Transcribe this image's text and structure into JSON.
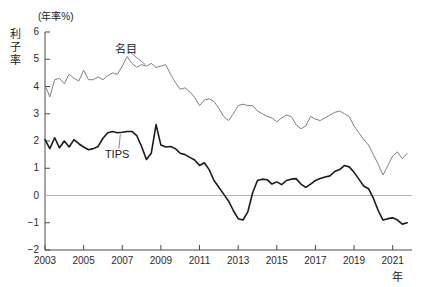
{
  "chart_data": {
    "type": "line",
    "title": "",
    "unit_note": "(年率%)",
    "ylabel": "利子率",
    "xlabel": "年",
    "ylim": [
      -2,
      6
    ],
    "xlim": [
      2003,
      2022
    ],
    "yticks": [
      6,
      5,
      4,
      3,
      2,
      1,
      0,
      -1,
      -2
    ],
    "ytick_labels": [
      "6",
      "5",
      "4",
      "3",
      "2",
      "1",
      "0",
      "−1",
      "−2"
    ],
    "xticks": [
      2003,
      2005,
      2007,
      2009,
      2011,
      2013,
      2015,
      2017,
      2019,
      2021
    ],
    "xtick_labels": [
      "2003",
      "2005",
      "2007",
      "2009",
      "2011",
      "2013",
      "2015",
      "2017",
      "2019",
      "2021"
    ],
    "grid": false,
    "zero_line": true,
    "legend_position": "inline-annotation",
    "series": [
      {
        "name": "名目",
        "label": "名目",
        "color": "#808080",
        "width": 1,
        "label_x": 2006.6,
        "label_y": 5.45,
        "anchor_x": 2008.2,
        "anchor_y": 4.8,
        "x": [
          2003.0,
          2003.25,
          2003.5,
          2003.75,
          2004.0,
          2004.25,
          2004.5,
          2004.75,
          2005.0,
          2005.25,
          2005.5,
          2005.75,
          2006.0,
          2006.25,
          2006.5,
          2006.75,
          2007.0,
          2007.25,
          2007.5,
          2007.75,
          2008.0,
          2008.25,
          2008.5,
          2008.75,
          2009.0,
          2009.25,
          2009.5,
          2009.75,
          2010.0,
          2010.25,
          2010.5,
          2010.75,
          2011.0,
          2011.25,
          2011.5,
          2011.75,
          2012.0,
          2012.25,
          2012.5,
          2012.75,
          2013.0,
          2013.25,
          2013.5,
          2013.75,
          2014.0,
          2014.25,
          2014.5,
          2014.75,
          2015.0,
          2015.25,
          2015.5,
          2015.75,
          2016.0,
          2016.25,
          2016.5,
          2016.75,
          2017.0,
          2017.25,
          2017.5,
          2017.75,
          2018.0,
          2018.25,
          2018.5,
          2018.75,
          2019.0,
          2019.25,
          2019.5,
          2019.75,
          2020.0,
          2020.25,
          2020.5,
          2020.75,
          2021.0,
          2021.25,
          2021.5,
          2021.75
        ],
        "values": [
          4.05,
          3.62,
          4.25,
          4.3,
          4.1,
          4.45,
          4.3,
          4.2,
          4.6,
          4.25,
          4.25,
          4.35,
          4.25,
          4.4,
          4.5,
          4.45,
          4.75,
          5.1,
          4.85,
          4.7,
          4.8,
          4.75,
          4.85,
          4.7,
          4.75,
          4.8,
          4.45,
          4.15,
          3.9,
          3.95,
          3.8,
          3.6,
          3.3,
          3.5,
          3.55,
          3.45,
          3.2,
          2.9,
          2.75,
          3.0,
          3.3,
          3.35,
          3.3,
          3.3,
          3.1,
          3.0,
          2.9,
          2.85,
          2.7,
          2.85,
          2.95,
          2.9,
          2.6,
          2.45,
          2.55,
          2.9,
          2.8,
          2.75,
          2.85,
          2.95,
          3.05,
          3.1,
          3.0,
          2.9,
          2.55,
          2.3,
          2.05,
          1.85,
          1.5,
          1.15,
          0.75,
          1.1,
          1.45,
          1.6,
          1.35,
          1.55
        ]
      },
      {
        "name": "TIPS",
        "label": "TIPS",
        "color": "#1a1a1a",
        "width": 1.6,
        "label_x": 2006.1,
        "label_y": 1.47,
        "anchor_x": 2006.9,
        "anchor_y": 2.25,
        "x": [
          2003.0,
          2003.25,
          2003.5,
          2003.75,
          2004.0,
          2004.25,
          2004.5,
          2004.75,
          2005.0,
          2005.25,
          2005.5,
          2005.75,
          2006.0,
          2006.25,
          2006.5,
          2006.75,
          2007.0,
          2007.25,
          2007.5,
          2007.75,
          2008.0,
          2008.25,
          2008.5,
          2008.75,
          2009.0,
          2009.25,
          2009.5,
          2009.75,
          2010.0,
          2010.25,
          2010.5,
          2010.75,
          2011.0,
          2011.25,
          2011.5,
          2011.75,
          2012.0,
          2012.25,
          2012.5,
          2012.75,
          2013.0,
          2013.25,
          2013.5,
          2013.75,
          2014.0,
          2014.25,
          2014.5,
          2014.75,
          2015.0,
          2015.25,
          2015.5,
          2015.75,
          2016.0,
          2016.25,
          2016.5,
          2016.75,
          2017.0,
          2017.25,
          2017.5,
          2017.75,
          2018.0,
          2018.25,
          2018.5,
          2018.75,
          2019.0,
          2019.25,
          2019.5,
          2019.75,
          2020.0,
          2020.25,
          2020.5,
          2020.75,
          2021.0,
          2021.25,
          2021.5,
          2021.75
        ],
        "values": [
          2.05,
          1.72,
          2.12,
          1.75,
          2.0,
          1.78,
          2.05,
          1.9,
          1.78,
          1.68,
          1.72,
          1.8,
          2.1,
          2.3,
          2.35,
          2.3,
          2.32,
          2.35,
          2.35,
          2.2,
          1.8,
          1.32,
          1.55,
          2.6,
          1.85,
          1.78,
          1.8,
          1.72,
          1.55,
          1.5,
          1.4,
          1.3,
          1.1,
          1.2,
          0.95,
          0.55,
          0.3,
          0.05,
          -0.2,
          -0.55,
          -0.85,
          -0.9,
          -0.6,
          0.1,
          0.55,
          0.6,
          0.58,
          0.42,
          0.5,
          0.4,
          0.55,
          0.6,
          0.62,
          0.42,
          0.3,
          0.42,
          0.55,
          0.62,
          0.68,
          0.72,
          0.88,
          0.95,
          1.1,
          1.05,
          0.85,
          0.6,
          0.35,
          0.25,
          -0.1,
          -0.55,
          -0.9,
          -0.85,
          -0.82,
          -0.9,
          -1.05,
          -1.0
        ]
      }
    ]
  }
}
